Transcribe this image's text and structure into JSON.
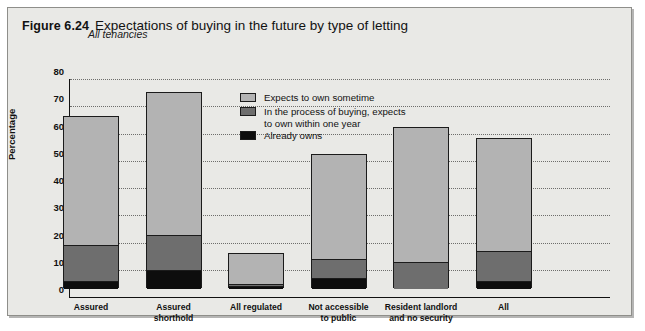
{
  "figure": {
    "number": "Figure 6.24",
    "title": "Expectations of buying in the future by type of letting",
    "subtitle": "All tenancies"
  },
  "colors": {
    "light_gray": "#b3b3b3",
    "mid_gray": "#6e6e6e",
    "black": "#0d0d0d",
    "panel_bg": "#e9e9e6",
    "outline": "#1b1b1b"
  },
  "legend": {
    "position": "inside-top-center",
    "items": [
      {
        "label": "Expects to own sometime",
        "swatch": "#b3b3b3"
      },
      {
        "label": "In the process of buying, expects",
        "label2": "to own within one year",
        "swatch": "#6e6e6e"
      },
      {
        "label": "Already owns",
        "swatch": "#0d0d0d"
      }
    ]
  },
  "chart_data": {
    "type": "bar",
    "stacked": true,
    "title": "Expectations of buying in the future by type of letting",
    "subtitle": "All tenancies",
    "xlabel": "",
    "ylabel": "Percentage",
    "ylim": [
      0,
      80
    ],
    "yticks": [
      0,
      10,
      20,
      30,
      40,
      50,
      60,
      70,
      80
    ],
    "grid": true,
    "categories": [
      "Assured",
      "Assured shorthold",
      "All regulated",
      "Not accessible to public",
      "Resident landlord and no security",
      "All"
    ],
    "category_labels": [
      [
        "Assured"
      ],
      [
        "Assured",
        "shorthold"
      ],
      [
        "All regulated"
      ],
      [
        "Not accessible",
        "to public"
      ],
      [
        "Resident landlord",
        "and no security"
      ],
      [
        "All"
      ]
    ],
    "series": [
      {
        "name": "Already owns",
        "color": "#0d0d0d",
        "values": [
          3,
          7,
          1,
          4,
          0,
          3
        ]
      },
      {
        "name": "In the process of buying, expects to own within one year",
        "color": "#6e6e6e",
        "values": [
          13,
          13,
          1,
          7,
          10,
          11
        ]
      },
      {
        "name": "Expects to own sometime",
        "color": "#b3b3b3",
        "values": [
          47,
          52,
          11,
          38,
          49,
          41
        ]
      }
    ],
    "totals": [
      63,
      72,
      13,
      49,
      59,
      55
    ]
  }
}
